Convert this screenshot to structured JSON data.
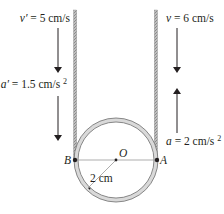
{
  "figure": {
    "left_rope": {
      "velocity_label": "v′ = 5 cm/s",
      "velocity_symbol": "v′",
      "velocity_value": "= 5 cm/s",
      "acceleration_symbol": "a′",
      "acceleration_value": "= 1.5 cm/s",
      "acceleration_exponent": "2",
      "velocity_direction": "down",
      "acceleration_direction": "down"
    },
    "right_rope": {
      "velocity_symbol": "v",
      "velocity_value": "= 6 cm/s",
      "acceleration_symbol": "a",
      "acceleration_value": "= 2 cm/s",
      "acceleration_exponent": "2",
      "velocity_direction": "down",
      "acceleration_direction": "up"
    },
    "points": {
      "left": "B",
      "right": "A",
      "center": "O"
    },
    "radius_label": "2 cm",
    "colors": {
      "ink": "#231f20",
      "rope": "#9a9a9a",
      "ring_fill": "#d9d9d9",
      "ring_edge": "#6d6d6d",
      "diameter_line": "#8a8a8a"
    }
  }
}
